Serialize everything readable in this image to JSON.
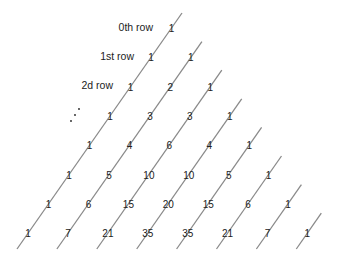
{
  "row_labels": [
    "0th row",
    "1st row",
    "2d row"
  ],
  "ellipsis": "...",
  "rows": [
    [
      1
    ],
    [
      1,
      1
    ],
    [
      1,
      2,
      1
    ],
    [
      1,
      3,
      3,
      1
    ],
    [
      1,
      4,
      6,
      4,
      1
    ],
    [
      1,
      5,
      10,
      10,
      5,
      1
    ],
    [
      1,
      6,
      15,
      20,
      15,
      6,
      1
    ],
    [
      1,
      7,
      21,
      35,
      35,
      21,
      7,
      1
    ]
  ],
  "line_color": "#8a8a8a"
}
